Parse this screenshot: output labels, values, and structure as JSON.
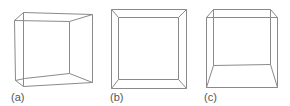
{
  "figure": {
    "panels": [
      {
        "label": "(a)",
        "description": "wireframe cube viewed from left, perspective",
        "label_pos": [
          11,
          101
        ],
        "edges": [
          [
            23,
            12,
            92,
            14
          ],
          [
            14,
            20,
            23,
            12
          ],
          [
            14,
            20,
            69,
            21
          ],
          [
            92,
            14,
            69,
            21
          ],
          [
            14,
            20,
            15,
            80
          ],
          [
            23,
            12,
            23,
            86
          ],
          [
            69,
            21,
            69,
            73
          ],
          [
            92,
            14,
            92,
            82
          ],
          [
            15,
            80,
            23,
            86
          ],
          [
            23,
            86,
            92,
            82
          ],
          [
            15,
            80,
            24,
            78
          ],
          [
            24,
            78,
            69,
            73
          ],
          [
            69,
            73,
            92,
            82
          ]
        ]
      },
      {
        "label": "(b)",
        "description": "wireframe cube viewed head-on",
        "label_pos": [
          110,
          101
        ],
        "edges": [
          [
            111,
            9,
            186,
            9
          ],
          [
            186,
            9,
            186,
            88
          ],
          [
            186,
            88,
            111,
            88
          ],
          [
            111,
            88,
            111,
            9
          ],
          [
            118,
            17,
            178,
            17
          ],
          [
            178,
            17,
            178,
            79
          ],
          [
            178,
            79,
            118,
            79
          ],
          [
            118,
            79,
            118,
            17
          ],
          [
            111,
            9,
            118,
            17
          ],
          [
            186,
            9,
            178,
            17
          ],
          [
            186,
            88,
            178,
            79
          ],
          [
            111,
            88,
            118,
            79
          ]
        ]
      },
      {
        "label": "(c)",
        "description": "wireframe cube viewed from above-left, perspective",
        "label_pos": [
          204,
          101
        ],
        "edges": [
          [
            213,
            9,
            270,
            9
          ],
          [
            270,
            9,
            277,
            17
          ],
          [
            213,
            9,
            206,
            17
          ],
          [
            206,
            17,
            277,
            17
          ],
          [
            206,
            17,
            206,
            87
          ],
          [
            213,
            9,
            213,
            65
          ],
          [
            270,
            9,
            270,
            64
          ],
          [
            277,
            17,
            277,
            87
          ],
          [
            213,
            65,
            270,
            64
          ],
          [
            206,
            87,
            277,
            87
          ],
          [
            213,
            65,
            206,
            87
          ],
          [
            270,
            64,
            277,
            87
          ]
        ]
      }
    ]
  }
}
